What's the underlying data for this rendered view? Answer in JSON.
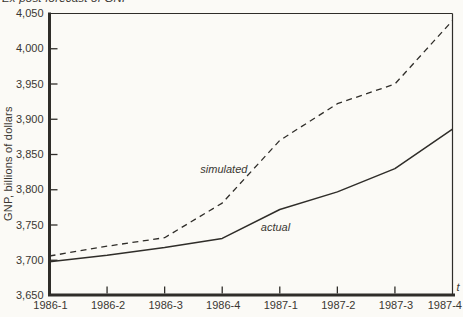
{
  "figure": {
    "title_partial": "Ex post forecast of GNP",
    "ylabel": "GNP, billions of dollars",
    "time_axis_label": "t"
  },
  "colors": {
    "background": "#fbfaf6",
    "ink": "#3a3732",
    "line": "#2f2d29"
  },
  "chart_data": {
    "type": "line",
    "title": "Ex post forecast of GNP",
    "xlabel": "t",
    "ylabel": "GNP, billions of dollars",
    "categories": [
      "1986-1",
      "1986-2",
      "1986-3",
      "1986-4",
      "1987-1",
      "1987-2",
      "1987-3",
      "1987-4"
    ],
    "ylim": [
      3650,
      4050
    ],
    "ytick_step": 50,
    "ytick_labels": [
      "3,650",
      "3,700",
      "3,750",
      "3,800",
      "3,850",
      "3,900",
      "3,950",
      "4,000",
      "4,050"
    ],
    "grid": false,
    "legend": "inline-annotations",
    "series": [
      {
        "name": "simulated",
        "label": "simulated",
        "line_style": "dashed",
        "values": [
          3706,
          3720,
          3732,
          3781,
          3870,
          3922,
          3950,
          4040
        ],
        "label_anchor": {
          "x_index": 2.62,
          "y": 3824
        }
      },
      {
        "name": "actual",
        "label": "actual",
        "line_style": "solid",
        "values": [
          3698,
          3707,
          3718,
          3731,
          3772,
          3797,
          3830,
          3886
        ],
        "label_anchor": {
          "x_index": 3.67,
          "y": 3742
        }
      }
    ]
  }
}
